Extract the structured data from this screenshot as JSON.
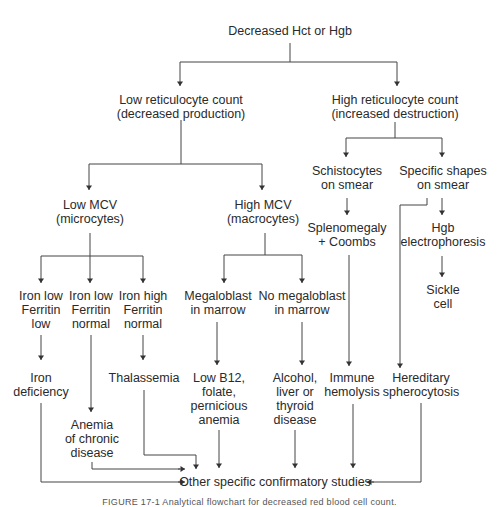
{
  "diagram": {
    "type": "flowchart",
    "root": {
      "lines": [
        "Decreased Hct or Hgb"
      ]
    },
    "nodes": {
      "low_retic": {
        "lines": [
          "Low reticulocyte count",
          "(decreased production)"
        ]
      },
      "high_retic": {
        "lines": [
          "High reticulocyte count",
          "(increased destruction)"
        ]
      },
      "low_mcv": {
        "lines": [
          "Low MCV",
          "(microcytes)"
        ]
      },
      "high_mcv": {
        "lines": [
          "High MCV",
          "(macrocytes)"
        ]
      },
      "schistocytes": {
        "lines": [
          "Schistocytes",
          "on smear"
        ]
      },
      "specific_shapes": {
        "lines": [
          "Specific shapes",
          "on smear"
        ]
      },
      "splenomegaly": {
        "lines": [
          "Splenomegaly",
          "+ Coombs"
        ]
      },
      "hgb_electro": {
        "lines": [
          "Hgb",
          "electrophoresis"
        ]
      },
      "sickle": {
        "lines": [
          "Sickle",
          "cell"
        ]
      },
      "iron_low_ferr_low": {
        "lines": [
          "Iron low",
          "Ferritin",
          "low"
        ]
      },
      "iron_low_ferr_norm": {
        "lines": [
          "Iron low",
          "Ferritin",
          "normal"
        ]
      },
      "iron_high_ferr_norm": {
        "lines": [
          "Iron high",
          "Ferritin",
          "normal"
        ]
      },
      "megaloblast": {
        "lines": [
          "Megaloblast",
          "in marrow"
        ]
      },
      "no_megaloblast": {
        "lines": [
          "No megaloblast",
          "in marrow"
        ]
      },
      "iron_def": {
        "lines": [
          "Iron",
          "deficiency"
        ]
      },
      "thalassemia": {
        "lines": [
          "Thalassemia"
        ]
      },
      "anemia_chronic": {
        "lines": [
          "Anemia",
          "of chronic",
          "disease"
        ]
      },
      "low_b12": {
        "lines": [
          "Low B12,",
          "folate,",
          "pernicious",
          "anemia"
        ]
      },
      "alcohol": {
        "lines": [
          "Alcohol,",
          "liver or",
          "thyroid",
          "disease"
        ]
      },
      "immune": {
        "lines": [
          "Immune",
          "hemolysis"
        ]
      },
      "hereditary": {
        "lines": [
          "Hereditary",
          "spherocytosis"
        ]
      },
      "confirm": {
        "lines": [
          "Other specific confirmatory studies"
        ]
      }
    },
    "caption": "FIGURE 17-1 Analytical flowchart for decreased red blood cell count."
  }
}
